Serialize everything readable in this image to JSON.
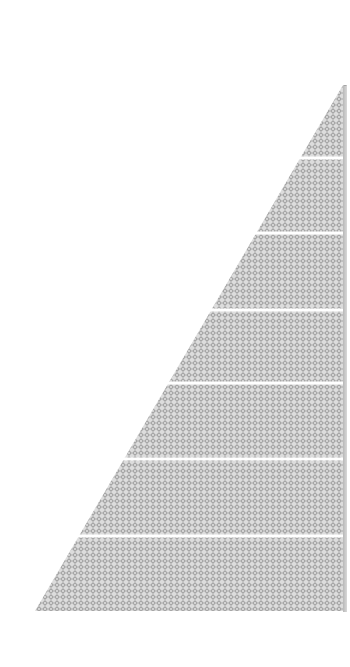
{
  "chart_data": {
    "type": "pyramid",
    "title": "",
    "orientation": "right-aligned triangle",
    "segments": 7,
    "segment_boundaries_px": [
      85,
      158,
      233,
      310,
      383,
      459,
      536,
      611
    ],
    "labels": [],
    "values": [],
    "fill": "diamond-hatch gray",
    "colors": {
      "fill_light": "#e6e6e6",
      "fill_dark": "#9a9a9a",
      "separator": "#ffffff",
      "background": "#ffffff"
    },
    "legend": "none",
    "axes": "none"
  },
  "geometry": {
    "apex": [
      343,
      85
    ],
    "base_left": [
      35,
      611
    ],
    "base_right": [
      346,
      611
    ]
  }
}
